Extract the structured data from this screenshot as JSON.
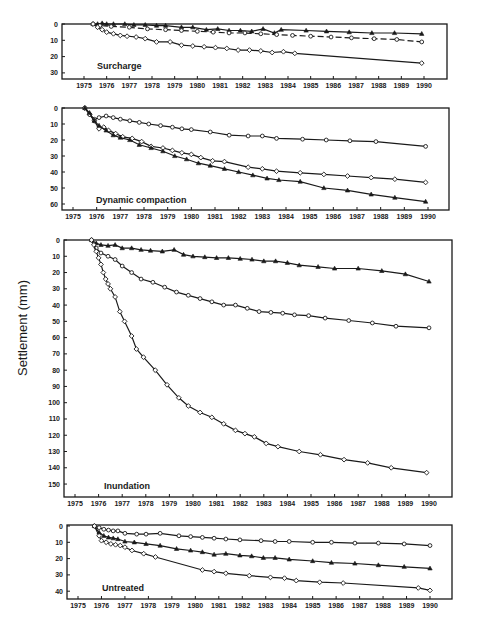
{
  "figure": {
    "ylabel": "Settlement (mm)"
  },
  "chart_data": [
    {
      "type": "line",
      "title": "Surcharge",
      "xlabel": "",
      "ylabel": "Settlement (mm)",
      "y_inverted": true,
      "ylim": [
        0,
        35
      ],
      "yticks": [
        0,
        10,
        20,
        30
      ],
      "xlim": [
        1975,
        1991
      ],
      "xticks": [
        1975,
        1976,
        1977,
        1978,
        1979,
        1980,
        1981,
        1982,
        1983,
        1984,
        1985,
        1986,
        1987,
        1988,
        1989,
        1990
      ],
      "grid": false,
      "series": [
        {
          "name": "triangle",
          "marker": "triangle",
          "x": [
            1975.4,
            1975.6,
            1975.8,
            1976.0,
            1976.3,
            1976.8,
            1977.2,
            1977.7,
            1978.2,
            1978.6,
            1979.3,
            1979.8,
            1980.4,
            1980.9,
            1981.4,
            1981.9,
            1982.4,
            1982.9,
            1983.4,
            1983.7,
            1984.8,
            1985.7,
            1986.7,
            1987.7,
            1988.7,
            1989.9
          ],
          "y": [
            0,
            0,
            -0.5,
            0,
            0,
            0,
            0.5,
            0.5,
            1,
            1,
            2,
            2,
            3.5,
            3,
            4,
            4,
            4.5,
            3,
            5.5,
            3.5,
            4,
            4.5,
            5,
            5.5,
            5.5,
            6
          ]
        },
        {
          "name": "circle-dashed",
          "marker": "circle",
          "dashed": true,
          "x": [
            1975.4,
            1975.7,
            1976.2,
            1977.0,
            1977.8,
            1978.6,
            1979.3,
            1980.0,
            1980.7,
            1981.4,
            1982.1,
            1982.8,
            1983.5,
            1984.2,
            1985.0,
            1985.9,
            1986.8,
            1987.8,
            1988.8,
            1989.9
          ],
          "y": [
            0,
            1,
            1.5,
            2,
            3,
            3.5,
            4,
            4.5,
            5,
            5.5,
            5.5,
            6,
            6.5,
            7,
            7.5,
            8,
            8.5,
            9,
            9.5,
            11
          ]
        },
        {
          "name": "diamond",
          "marker": "diamond",
          "x": [
            1975.4,
            1975.6,
            1975.8,
            1976.0,
            1976.3,
            1976.6,
            1976.9,
            1977.3,
            1977.7,
            1978.2,
            1978.8,
            1979.3,
            1979.8,
            1980.3,
            1980.8,
            1981.3,
            1981.8,
            1982.3,
            1982.8,
            1983.3,
            1983.8,
            1984.3,
            1989.9
          ],
          "y": [
            0,
            2,
            3.5,
            5,
            6,
            7,
            7.5,
            8,
            9,
            11,
            11,
            13,
            13.5,
            14,
            14.5,
            15,
            16,
            16,
            16.5,
            17.5,
            17,
            18,
            24
          ]
        }
      ]
    },
    {
      "type": "line",
      "title": "Dynamic compaction",
      "xlabel": "",
      "ylabel": "Settlement (mm)",
      "y_inverted": true,
      "ylim": [
        0,
        64
      ],
      "yticks": [
        0,
        10,
        20,
        30,
        40,
        50,
        60
      ],
      "xlim": [
        1975,
        1991
      ],
      "xticks": [
        1975,
        1976,
        1977,
        1978,
        1979,
        1980,
        1981,
        1982,
        1983,
        1984,
        1985,
        1986,
        1987,
        1988,
        1989,
        1990
      ],
      "grid": false,
      "series": [
        {
          "name": "circle",
          "marker": "circle",
          "x": [
            1975.5,
            1975.7,
            1975.9,
            1976.1,
            1976.4,
            1976.7,
            1977.0,
            1977.4,
            1977.8,
            1978.2,
            1978.7,
            1979.2,
            1979.6,
            1980.0,
            1980.8,
            1981.6,
            1982.4,
            1983.0,
            1983.6,
            1984.7,
            1985.7,
            1986.7,
            1987.8,
            1989.9
          ],
          "y": [
            0,
            4,
            7,
            6,
            5,
            6,
            7,
            8,
            9,
            10,
            11,
            12,
            13,
            13.5,
            15,
            17,
            17.5,
            17.5,
            19,
            19.5,
            20,
            20.5,
            21,
            24
          ]
        },
        {
          "name": "diamond",
          "marker": "diamond",
          "x": [
            1975.5,
            1975.7,
            1975.9,
            1976.1,
            1976.3,
            1976.5,
            1976.8,
            1977.1,
            1977.5,
            1977.9,
            1978.3,
            1978.8,
            1979.2,
            1979.6,
            1980.0,
            1980.4,
            1980.9,
            1981.4,
            1982.4,
            1983.0,
            1983.6,
            1984.6,
            1985.6,
            1986.6,
            1987.6,
            1988.6,
            1989.9
          ],
          "y": [
            0,
            4,
            8,
            13,
            12,
            14,
            16,
            18,
            19,
            21,
            24,
            25,
            26.5,
            28,
            29,
            31,
            33,
            33.5,
            37,
            38,
            39.5,
            40.5,
            41.5,
            42.5,
            43.5,
            44.5,
            46.5
          ]
        },
        {
          "name": "triangle",
          "marker": "triangle",
          "x": [
            1975.5,
            1975.7,
            1975.9,
            1976.1,
            1976.4,
            1976.7,
            1977.0,
            1977.4,
            1977.8,
            1978.3,
            1978.8,
            1979.3,
            1979.8,
            1980.3,
            1980.8,
            1981.4,
            1982.0,
            1982.6,
            1983.2,
            1983.7,
            1984.6,
            1985.6,
            1986.6,
            1987.6,
            1988.6,
            1989.9
          ],
          "y": [
            0,
            3,
            8,
            11,
            14,
            17,
            18.5,
            20,
            23,
            25,
            27,
            30,
            32,
            34.5,
            36,
            38,
            40,
            42,
            44,
            45,
            46,
            50,
            51.5,
            54,
            56,
            58.5
          ]
        }
      ]
    },
    {
      "type": "line",
      "title": "Inundation",
      "xlabel": "",
      "ylabel": "Settlement (mm)",
      "y_inverted": true,
      "ylim": [
        0,
        158
      ],
      "yticks": [
        0,
        10,
        20,
        30,
        40,
        50,
        60,
        70,
        80,
        90,
        100,
        110,
        120,
        130,
        140,
        150
      ],
      "xlim": [
        1975,
        1991
      ],
      "xticks": [
        1975,
        1976,
        1977,
        1978,
        1979,
        1980,
        1981,
        1982,
        1983,
        1984,
        1985,
        1986,
        1987,
        1988,
        1989,
        1990
      ],
      "grid": false,
      "series": [
        {
          "name": "triangle",
          "marker": "triangle",
          "x": [
            1975.7,
            1975.9,
            1976.1,
            1976.4,
            1976.7,
            1977.0,
            1977.4,
            1977.8,
            1978.2,
            1978.7,
            1979.2,
            1979.6,
            1980.0,
            1980.5,
            1981.0,
            1981.5,
            1982.0,
            1982.5,
            1983.0,
            1983.5,
            1984.0,
            1984.5,
            1985.3,
            1986.0,
            1987.0,
            1988.0,
            1989.0,
            1990.0
          ],
          "y": [
            0,
            2,
            3,
            3.5,
            3,
            5,
            5,
            6,
            6.5,
            7,
            6,
            9,
            10,
            10.5,
            11,
            11,
            11.5,
            12,
            13,
            13,
            14,
            15.5,
            16.5,
            17.5,
            17.5,
            19,
            21,
            25.5
          ]
        },
        {
          "name": "circle",
          "marker": "circle",
          "x": [
            1975.7,
            1975.9,
            1976.1,
            1976.4,
            1976.7,
            1977.0,
            1977.4,
            1977.8,
            1978.3,
            1978.8,
            1979.3,
            1979.8,
            1980.3,
            1980.8,
            1981.3,
            1981.8,
            1982.3,
            1982.8,
            1983.3,
            1983.8,
            1984.3,
            1984.9,
            1985.6,
            1986.6,
            1987.6,
            1988.6,
            1990.0
          ],
          "y": [
            0,
            5,
            8,
            10,
            12,
            16,
            20,
            24,
            26,
            29,
            32,
            34,
            36,
            38,
            40,
            40,
            42,
            44,
            44.5,
            45,
            46,
            46.5,
            48,
            49.5,
            51,
            53,
            54
          ]
        },
        {
          "name": "diamond",
          "marker": "diamond",
          "x": [
            1975.7,
            1975.8,
            1975.9,
            1976.0,
            1976.1,
            1976.2,
            1976.3,
            1976.4,
            1976.5,
            1976.7,
            1976.9,
            1977.1,
            1977.4,
            1977.6,
            1977.9,
            1978.4,
            1978.9,
            1979.4,
            1979.8,
            1980.3,
            1980.8,
            1981.3,
            1981.8,
            1982.2,
            1982.6,
            1983.1,
            1983.6,
            1984.5,
            1985.4,
            1986.4,
            1987.4,
            1988.4,
            1989.9
          ],
          "y": [
            0,
            3,
            7,
            11,
            15,
            20,
            24,
            27,
            30,
            35,
            44,
            50,
            59,
            67,
            72,
            80,
            89,
            97,
            102,
            106,
            109,
            113,
            117,
            119,
            121,
            125,
            127,
            130,
            132,
            135,
            137,
            140,
            143
          ]
        }
      ]
    },
    {
      "type": "line",
      "title": "Untreated",
      "xlabel": "",
      "ylabel": "Settlement (mm)",
      "y_inverted": true,
      "ylim": [
        0,
        45
      ],
      "yticks": [
        0,
        10,
        20,
        30,
        40
      ],
      "xlim": [
        1975,
        1991
      ],
      "xticks": [
        1975,
        1976,
        1977,
        1978,
        1979,
        1980,
        1981,
        1982,
        1983,
        1984,
        1985,
        1986,
        1987,
        1988,
        1989,
        1990
      ],
      "grid": false,
      "series": [
        {
          "name": "circle",
          "marker": "circle",
          "x": [
            1975.7,
            1975.9,
            1976.1,
            1976.3,
            1976.5,
            1976.7,
            1977.0,
            1977.5,
            1977.9,
            1978.5,
            1979.3,
            1979.8,
            1980.3,
            1980.8,
            1981.3,
            1981.9,
            1982.8,
            1983.4,
            1984.0,
            1985.0,
            1985.8,
            1986.8,
            1987.8,
            1988.9,
            1990.0
          ],
          "y": [
            0,
            1,
            2,
            2.5,
            3,
            3,
            4.5,
            5,
            5,
            4.5,
            6,
            6.5,
            7,
            7.5,
            8,
            8.5,
            9,
            9.5,
            9.5,
            10,
            10,
            10.5,
            10.5,
            11,
            12
          ]
        },
        {
          "name": "triangle",
          "marker": "triangle",
          "x": [
            1975.7,
            1975.9,
            1976.1,
            1976.3,
            1976.5,
            1976.7,
            1977.0,
            1977.4,
            1977.9,
            1978.5,
            1979.2,
            1979.8,
            1980.3,
            1980.8,
            1981.3,
            1981.9,
            1982.4,
            1982.9,
            1983.4,
            1984.0,
            1985.0,
            1985.8,
            1986.8,
            1987.8,
            1988.9,
            1990.0
          ],
          "y": [
            0,
            4,
            6,
            7,
            7.5,
            8,
            9.5,
            10,
            11,
            12,
            14,
            15,
            16,
            17.5,
            17,
            18,
            18.5,
            19.5,
            19.5,
            20.5,
            21.5,
            22.5,
            23,
            24,
            25,
            26
          ]
        },
        {
          "name": "diamond",
          "marker": "diamond",
          "x": [
            1975.7,
            1975.9,
            1976.0,
            1976.2,
            1976.4,
            1976.6,
            1976.8,
            1977.0,
            1977.3,
            1977.8,
            1978.3,
            1980.3,
            1980.8,
            1981.3,
            1982.3,
            1983.2,
            1983.8,
            1984.3,
            1985.3,
            1986.3,
            1989.5,
            1990.0
          ],
          "y": [
            0,
            6,
            9,
            10,
            11,
            11.5,
            12,
            13,
            15,
            17,
            19,
            27,
            28,
            29,
            30.5,
            31.5,
            32,
            33.5,
            34.5,
            35,
            38,
            39.5
          ]
        }
      ]
    }
  ]
}
